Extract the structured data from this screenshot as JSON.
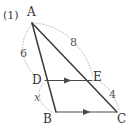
{
  "figure": {
    "item_number": "(1)",
    "vertices": [
      {
        "name": "A",
        "label": "A",
        "x": 32,
        "y": 23,
        "label_x": 27,
        "label_y": 6
      },
      {
        "name": "D",
        "label": "D",
        "x": 45,
        "y": 81,
        "label_x": 32,
        "label_y": 75
      },
      {
        "name": "B",
        "label": "B",
        "x": 56,
        "y": 112,
        "label_x": 43,
        "label_y": 112
      },
      {
        "name": "E",
        "label": "E",
        "x": 92,
        "y": 80,
        "label_x": 93,
        "label_y": 72
      },
      {
        "name": "C",
        "label": "C",
        "x": 117,
        "y": 112,
        "label_x": 117,
        "label_y": 112
      }
    ],
    "segments": [
      {
        "name": "segment-ab",
        "from": "A",
        "to": "B"
      },
      {
        "name": "segment-ac",
        "from": "A",
        "to": "C"
      },
      {
        "name": "segment-de",
        "from": "D",
        "to": "E",
        "arrow": true
      },
      {
        "name": "segment-bc",
        "from": "B",
        "to": "C",
        "arrow": true
      }
    ],
    "measures": [
      {
        "name": "measure-ad",
        "value": "6",
        "x": 20,
        "y": 48,
        "style": "num"
      },
      {
        "name": "measure-ae",
        "value": "8",
        "x": 70,
        "y": 37,
        "style": "num"
      },
      {
        "name": "measure-ec",
        "value": "4",
        "x": 109,
        "y": 89,
        "style": "num"
      },
      {
        "name": "measure-db",
        "value": "x",
        "x": 34,
        "y": 92,
        "style": "var"
      }
    ],
    "colors": {
      "stroke": "#3a3a3a",
      "guide": "#b9b9b9",
      "text": "#333333",
      "background": "#ffffff"
    }
  }
}
